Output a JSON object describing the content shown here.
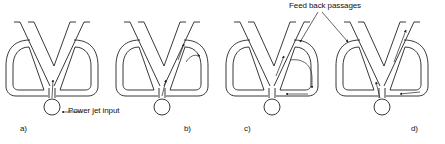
{
  "figure": {
    "annotations": {
      "power_jet_input": "Power jet input",
      "feedback_passages": "Feed back passages"
    },
    "panels": [
      {
        "label": "a)",
        "center_x": 52,
        "flow": "center"
      },
      {
        "label": "b)",
        "center_x": 162,
        "flow": "right-outlet"
      },
      {
        "label": "c)",
        "center_x": 272,
        "flow": "right-feedback-loop"
      },
      {
        "label": "d)",
        "center_x": 382,
        "flow": "switch-to-right"
      }
    ],
    "colors": {
      "line": "#222222",
      "background": "#ffffff"
    }
  }
}
